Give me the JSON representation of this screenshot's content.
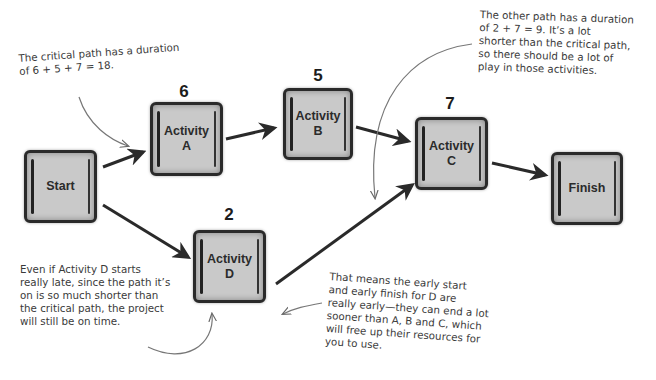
{
  "diagram": {
    "type": "network-diagram",
    "nodes": [
      {
        "id": "start",
        "label": "Start",
        "duration": null
      },
      {
        "id": "a",
        "label": "Activity\nA",
        "duration": "6"
      },
      {
        "id": "b",
        "label": "Activity\nB",
        "duration": "5"
      },
      {
        "id": "c",
        "label": "Activity\nC",
        "duration": "7"
      },
      {
        "id": "d",
        "label": "Activity\nD",
        "duration": "2"
      },
      {
        "id": "finish",
        "label": "Finish",
        "duration": null
      }
    ],
    "edges": [
      {
        "from": "start",
        "to": "a"
      },
      {
        "from": "a",
        "to": "b"
      },
      {
        "from": "b",
        "to": "c"
      },
      {
        "from": "c",
        "to": "finish"
      },
      {
        "from": "start",
        "to": "d"
      },
      {
        "from": "d",
        "to": "c"
      }
    ]
  },
  "annotations": {
    "critical_path": "The critical path has a duration\nof 6 + 5 + 7 = 18.",
    "other_path": "The other path has a duration\nof 2 + 7 = 9. It’s a lot\nshorter than the critical path,\nso there should be a lot of\nplay in those activities.",
    "activity_d_late": "Even if Activity D starts\nreally late, since the path it’s\non is so much shorter than\nthe critical path, the project\nwill still be on time.",
    "early_start_finish": "That means the early start\nand early finish for D are\nreally early—they can end a lot\nsooner than A, B and C, which\nwill free up their resources for\nyou to use."
  },
  "colors": {
    "node_fill": "#c9c9c9",
    "node_border": "#2a2a2a",
    "arrow": "#2a2a2a",
    "note_text": "#3a3a3a",
    "pointer_line": "#777777"
  }
}
